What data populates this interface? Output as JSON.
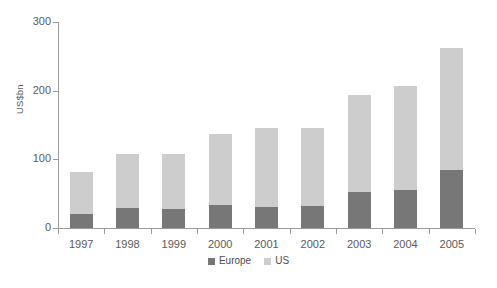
{
  "chart_data": {
    "type": "bar",
    "subtype": "stacked-vertical",
    "title": "",
    "subtitle": "",
    "xlabel": "",
    "ylabel": "US$bn",
    "categories": [
      "1997",
      "1998",
      "1999",
      "2000",
      "2001",
      "2002",
      "2003",
      "2004",
      "2005"
    ],
    "series": [
      {
        "name": "Europe",
        "color": "#777777",
        "values": [
          20,
          29,
          28,
          34,
          30,
          32,
          52,
          55,
          84
        ]
      },
      {
        "name": "US",
        "color": "#cdcdcd",
        "values": [
          61,
          79,
          80,
          103,
          116,
          114,
          141,
          152,
          178
        ]
      }
    ],
    "totals": [
      81,
      108,
      108,
      137,
      146,
      146,
      193,
      207,
      262
    ],
    "ylim": [
      0,
      300
    ],
    "yticks": [
      0,
      100,
      200,
      300
    ],
    "ytick_labels": [
      "0",
      "100",
      "200",
      "300"
    ],
    "grid": false,
    "legend_position": "bottom-center",
    "legend_entries": [
      "Europe",
      "US"
    ],
    "annotations": []
  },
  "colors": {
    "europe": "#777777",
    "us": "#cdcdcd",
    "axis": "#9a9a9a",
    "text": "#5a5a5a",
    "background": "#ffffff"
  },
  "legend": {
    "items": [
      {
        "label": "Europe",
        "swatch": "legend-swatch-europe"
      },
      {
        "label": "US",
        "swatch": "legend-swatch-us"
      }
    ]
  }
}
